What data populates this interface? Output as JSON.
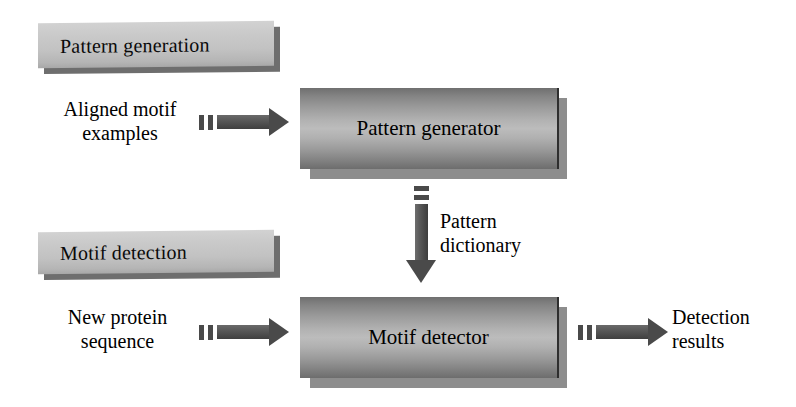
{
  "figure": {
    "background_color": "#ffffff",
    "box_fill_dark": "#6f6f6f",
    "box_fill_light": "#bcbcbc",
    "plaque_fill": "#c6c6c6",
    "arrow_color": "#4a4a4a",
    "text_color": "#000000"
  },
  "sections": [
    {
      "id": "pattern-generation",
      "label": "Pattern generation"
    },
    {
      "id": "motif-detection",
      "label": "Motif detection"
    }
  ],
  "processes": [
    {
      "id": "pattern-generator",
      "label": "Pattern generator"
    },
    {
      "id": "motif-detector",
      "label": "Motif detector"
    }
  ],
  "captions": {
    "aligned_motif_examples": "Aligned motif\nexamples",
    "pattern_dictionary": "Pattern\ndictionary",
    "new_protein_sequence": "New protein\nsequence",
    "detection_results": "Detection\nresults"
  },
  "arrows": [
    {
      "id": "input-to-pattern-generator",
      "direction": "right",
      "from": "Aligned motif examples",
      "to": "Pattern generator"
    },
    {
      "id": "pattern-generator-to-motif-detector",
      "direction": "down",
      "from": "Pattern generator",
      "to": "Motif detector",
      "label": "Pattern dictionary"
    },
    {
      "id": "input-to-motif-detector",
      "direction": "right",
      "from": "New protein sequence",
      "to": "Motif detector"
    },
    {
      "id": "motif-detector-to-results",
      "direction": "right",
      "from": "Motif detector",
      "to": "Detection results"
    }
  ]
}
